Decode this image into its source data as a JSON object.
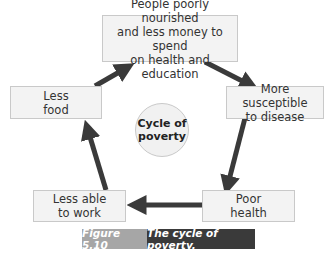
{
  "diagram": {
    "title": "Cycle of poverty",
    "center_label": "Cycle of\npoverty",
    "nodes": [
      {
        "id": "top",
        "label": "People poorly nourished\nand less money to spend\non health and education"
      },
      {
        "id": "right",
        "label": "More susceptible\nto disease"
      },
      {
        "id": "bottom_right",
        "label": "Poor\nhealth"
      },
      {
        "id": "bottom_left",
        "label": "Less able\nto work"
      },
      {
        "id": "left",
        "label": "Less\nfood"
      }
    ],
    "edges": [
      {
        "from": "top",
        "to": "right"
      },
      {
        "from": "right",
        "to": "bottom_right"
      },
      {
        "from": "bottom_right",
        "to": "bottom_left"
      },
      {
        "from": "bottom_left",
        "to": "left"
      },
      {
        "from": "left",
        "to": "top"
      }
    ],
    "colors": {
      "arrow": "#3a3a3a",
      "box_fill": "#f3f3f3",
      "box_border": "#c9c9c9"
    }
  },
  "caption": {
    "figure_number": "Figure 5.10",
    "title": "The cycle of poverty.",
    "number_bg": "#a6a6a6",
    "title_bg": "#3a3a3a"
  }
}
